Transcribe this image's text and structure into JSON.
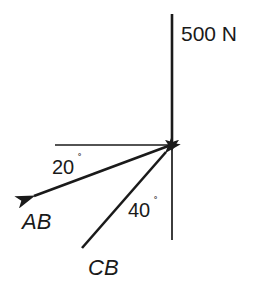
{
  "diagram": {
    "background_color": "#ffffff",
    "stroke_color": "#1a1a1a",
    "text_color": "#1a1a1a",
    "joint": {
      "x": 172,
      "y": 145
    },
    "labels": {
      "applied_load": "500 N",
      "member_ab": "AB",
      "member_cb": "CB",
      "angle_ab_value": "20",
      "angle_cb_value": "40",
      "degree_symbol": "˚"
    },
    "forces": [
      {
        "name": "applied-load",
        "label": "500 N",
        "magnitude": 500,
        "unit": "N",
        "direction": "downward-vertical",
        "angle_deg_from_horizontal": 90,
        "arrow_at": "joint",
        "start": {
          "x": 172,
          "y": 14
        },
        "end": {
          "x": 172,
          "y": 145
        }
      },
      {
        "name": "member-ab-force",
        "label": "AB",
        "direction": "down-left",
        "angle_deg": 20,
        "angle_reference": "horizontal",
        "arrow_at": "away-from-joint",
        "start": {
          "x": 172,
          "y": 145
        },
        "end": {
          "x": 28,
          "y": 198
        }
      },
      {
        "name": "member-cb-force",
        "label": "CB",
        "direction": "up-right",
        "angle_deg": 40,
        "angle_reference": "vertical",
        "arrow_at": "joint",
        "start": {
          "x": 82,
          "y": 248
        },
        "end": {
          "x": 172,
          "y": 145
        }
      }
    ],
    "reference_lines": [
      {
        "name": "horizontal-reference-line",
        "start": {
          "x": 55,
          "y": 145
        },
        "end": {
          "x": 172,
          "y": 145
        }
      },
      {
        "name": "vertical-reference-line",
        "start": {
          "x": 172,
          "y": 145
        },
        "end": {
          "x": 172,
          "y": 240
        }
      }
    ],
    "angles": [
      {
        "name": "angle-20",
        "value": "20",
        "symbol": "˚",
        "between": [
          "horizontal-reference-line",
          "member-ab-force"
        ],
        "label_pos": {
          "x": 52,
          "y": 173
        }
      },
      {
        "name": "angle-40",
        "value": "40",
        "symbol": "˚",
        "between": [
          "vertical-reference-line",
          "member-cb-force"
        ],
        "label_pos": {
          "x": 128,
          "y": 216
        }
      }
    ]
  }
}
